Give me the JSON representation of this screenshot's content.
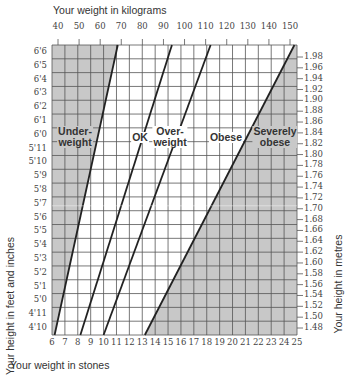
{
  "chart_data": {
    "type": "area",
    "title": "",
    "top_axis": {
      "label": "Your weight in kilograms",
      "ticks": [
        "40",
        "50",
        "60",
        "70",
        "80",
        "90",
        "100",
        "110",
        "120",
        "130",
        "140",
        "150"
      ]
    },
    "bottom_axis": {
      "label": "Your weight in stones",
      "ticks": [
        "6",
        "7",
        "8",
        "9",
        "10",
        "11",
        "12",
        "13",
        "14",
        "15",
        "16",
        "17",
        "18",
        "19",
        "20",
        "21",
        "22",
        "23",
        "24",
        "25"
      ]
    },
    "left_axis": {
      "label": "Your height in feet and inches",
      "ticks": [
        "6'6",
        "6'5",
        "6'4",
        "6'3",
        "6'2",
        "6'1",
        "6'0",
        "5'11",
        "5'10",
        "5'9",
        "5'8",
        "5'7",
        "5'6",
        "5'5",
        "5'4",
        "5'3",
        "5'2",
        "5'1",
        "5'0",
        "4'11",
        "4'10"
      ]
    },
    "right_axis": {
      "label": "Your height in metres",
      "ticks": [
        "1.98",
        "1.96",
        "1.94",
        "1.92",
        "1.90",
        "1.88",
        "1.86",
        "1.84",
        "1.82",
        "1.80",
        "1.78",
        "1.76",
        "1.74",
        "1.72",
        "1.70",
        "1.68",
        "1.66",
        "1.64",
        "1.62",
        "1.60",
        "1.58",
        "1.56",
        "1.54",
        "1.52",
        "1.50",
        "1.48"
      ]
    },
    "zones": [
      {
        "name": "Underweight",
        "label_lines": [
          "Under-",
          "weight"
        ],
        "shaded": true
      },
      {
        "name": "OK",
        "label_lines": [
          "OK"
        ],
        "shaded": false
      },
      {
        "name": "Overweight",
        "label_lines": [
          "Over-",
          "weight"
        ],
        "shaded": false
      },
      {
        "name": "Obese",
        "label_lines": [
          "Obese"
        ],
        "shaded": false
      },
      {
        "name": "Severely obese",
        "label_lines": [
          "Severely",
          "obese"
        ],
        "shaded": true
      }
    ],
    "boundaries_stones": [
      {
        "between": "Underweight/OK",
        "at_4ft10": 6.2,
        "at_6ft6": 11.1
      },
      {
        "between": "OK/Overweight",
        "at_4ft10": 8.2,
        "at_6ft6": 15.3
      },
      {
        "between": "Overweight/Obese",
        "at_4ft10": 10.0,
        "at_6ft6": 18.3
      },
      {
        "between": "Obese/Severely obese",
        "at_4ft10": 13.2,
        "at_6ft6": 24.8
      }
    ],
    "grid": true,
    "colors": {
      "shaded": "#c8c8c8",
      "grid": "#444444",
      "line": "#222222",
      "background": "#ffffff"
    }
  }
}
